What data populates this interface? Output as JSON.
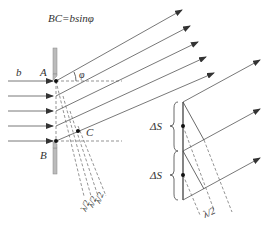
{
  "diagram": {
    "title_formula": "BC=bsinφ",
    "labels": {
      "slit_width": "b",
      "point_a": "A",
      "point_b": "B",
      "point_c": "C",
      "angle": "φ",
      "half_wave_1": "λ/2",
      "half_wave_2": "λ/2",
      "half_wave_3": "λ/2",
      "delta_s_upper": "ΔS",
      "delta_s_lower": "ΔS",
      "half_wave_right": "λ/2"
    },
    "colors": {
      "lines": "#555555",
      "slit_wall": "#aaaaaa",
      "text": "#333333"
    }
  }
}
